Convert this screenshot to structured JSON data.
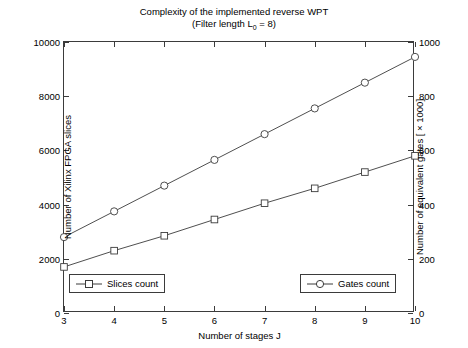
{
  "chart_data": {
    "type": "line",
    "title": "Complexity of the implemented reverse WPT",
    "subtitle_prefix": "(Filter length L",
    "subtitle_sub": "0",
    "subtitle_suffix": " = 8)",
    "xlabel": "Number of stages J",
    "ylabel_left": "Number of Xilinx FPGA slices",
    "ylabel_right": "Number of equivalent gates [ × 1000]",
    "x": [
      3,
      4,
      5,
      6,
      7,
      8,
      9,
      10
    ],
    "xlim": [
      3,
      10
    ],
    "xticks": [
      "3",
      "4",
      "5",
      "6",
      "7",
      "8",
      "9",
      "10"
    ],
    "ylim_left": [
      0,
      10000
    ],
    "yticks_left": [
      "0",
      "2000",
      "4000",
      "6000",
      "8000",
      "10000"
    ],
    "ytick_values_left": [
      0,
      2000,
      4000,
      6000,
      8000,
      10000
    ],
    "ylim_right": [
      0,
      1000
    ],
    "yticks_right": [
      "0",
      "200",
      "400",
      "600",
      "800",
      "1000"
    ],
    "ytick_values_right": [
      0,
      200,
      400,
      600,
      800,
      1000
    ],
    "grid": false,
    "legend_position": "bottom-inside",
    "series": [
      {
        "name": "Slices count",
        "axis": "left",
        "marker": "square",
        "color": "#3b3b3b",
        "values": [
          1700,
          2300,
          2850,
          3450,
          4050,
          4600,
          5200,
          5800
        ]
      },
      {
        "name": "Gates count",
        "axis": "right",
        "marker": "circle",
        "color": "#3b3b3b",
        "values": [
          280,
          375,
          470,
          565,
          660,
          755,
          850,
          945
        ]
      }
    ]
  },
  "legend": {
    "slices": "Slices count",
    "gates": "Gates count"
  },
  "colors": {
    "axis": "#3b3b3b",
    "line": "#3b3b3b",
    "background": "#ffffff"
  }
}
